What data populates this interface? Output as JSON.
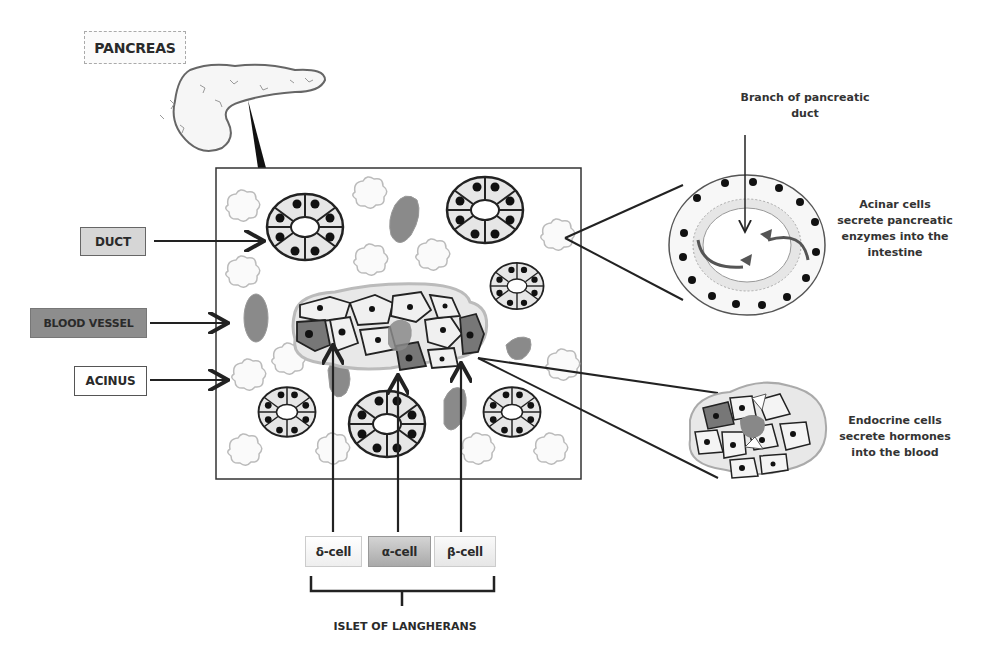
{
  "labels": {
    "pancreas": "PANCREAS",
    "duct": "DUCT",
    "blood_vessel": "BLOOD VESSEL",
    "acinus": "ACINUS",
    "delta_cell": "δ-cell",
    "alpha_cell": "α-cell",
    "beta_cell": "β-cell",
    "islet": "ISLET OF LANGHERANS"
  },
  "descriptions": {
    "branch_duct": "Branch of pancreatic duct",
    "acinar": "Acinar cells secrete pancreatic enzymes into the intestine",
    "endocrine": "Endocrine cells secrete hormones into the blood"
  },
  "colors": {
    "duct_fill": "#d6d6d6",
    "blood_vessel_fill": "#8d8d8d",
    "alpha_fill": "#b0b0b0",
    "outline": "#222222"
  }
}
